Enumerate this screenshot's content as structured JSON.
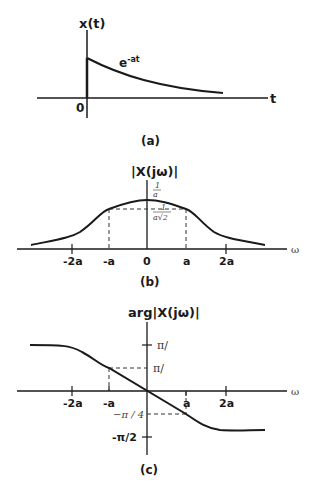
{
  "panel_a": {
    "ylabel": "x(t)",
    "xlabel": "t",
    "origin_label": "0",
    "curve_label_base": "e",
    "curve_label_exp": "-at",
    "caption": "(a)"
  },
  "panel_b": {
    "ylabel": "|X(jω)|",
    "xlabel": "ω",
    "peak_num": "1",
    "peak_den": "a",
    "half_num": "1",
    "half_den": "a√2",
    "ticks": [
      "-2a",
      "-a",
      "0",
      "a",
      "2a"
    ],
    "caption": "(b)"
  },
  "panel_c": {
    "ylabel": "arg|X(jω)|",
    "xlabel": "ω",
    "ytick_top": "π/",
    "ytick_mid": "π/",
    "ytick_neg_quarter": "−π / 4",
    "ytick_neg_half": "-π/2",
    "ticks": [
      "-2a",
      "-a",
      "a",
      "2a"
    ],
    "caption": "(c)"
  },
  "colors": {
    "line": "#1a1a1a",
    "background": "#ffffff"
  }
}
